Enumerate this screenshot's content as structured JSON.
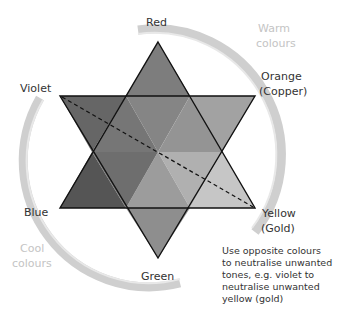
{
  "diagram": {
    "type": "colour-correction-star",
    "labels": {
      "red": "Red",
      "orange": "Orange",
      "orange_sub": "(Copper)",
      "yellow": "Yellow",
      "yellow_sub": "(Gold)",
      "green": "Green",
      "blue": "Blue",
      "violet": "Violet"
    },
    "arc_labels": {
      "warm_1": "Warm",
      "warm_2": "colours",
      "cool_1": "Cool",
      "cool_2": "colours"
    },
    "note": {
      "line1": "Use opposite colours",
      "line2": "to neutralise unwanted",
      "line3": "tones, e.g. violet to",
      "line4": "neutralise unwanted",
      "line5": "yellow (gold)"
    },
    "colors": {
      "arc": "#c8c8c8",
      "outline": "#111111",
      "red": "#7a7a7a",
      "orange": "#9a9a9a",
      "yellow": "#c0c0c0",
      "green": "#8a8a8a",
      "blue": "#5a5a5a",
      "violet": "#6a6a6a"
    }
  }
}
